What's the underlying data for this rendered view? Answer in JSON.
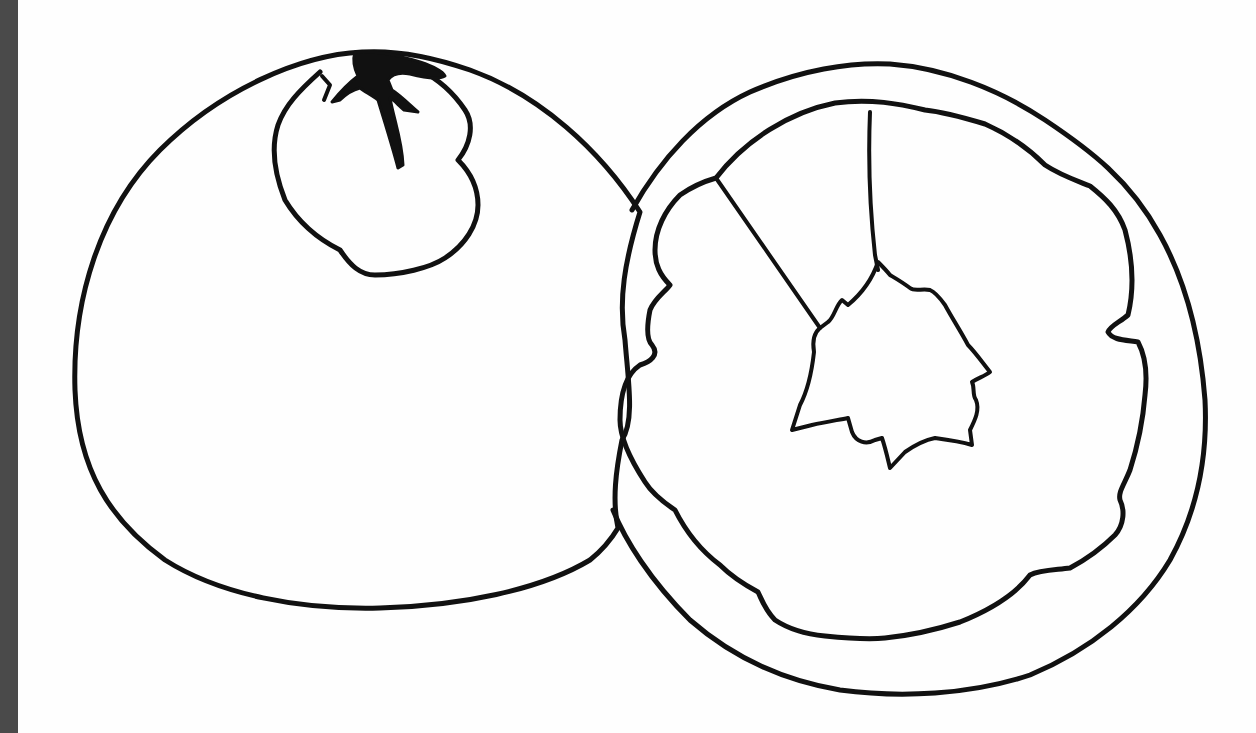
{
  "image": {
    "subject": "Line drawing of a whole orange and a halved orange",
    "style": "black outline coloring page",
    "colors": {
      "background": "#ffffff",
      "ink": "#111111",
      "left_strip": "#4a4a4a"
    },
    "objects": [
      {
        "name": "whole-orange",
        "parts": [
          "peel-outline",
          "stem-cap"
        ]
      },
      {
        "name": "halved-orange",
        "parts": [
          "rind-outer",
          "flesh-inner",
          "segment-lines",
          "core"
        ]
      }
    ]
  }
}
